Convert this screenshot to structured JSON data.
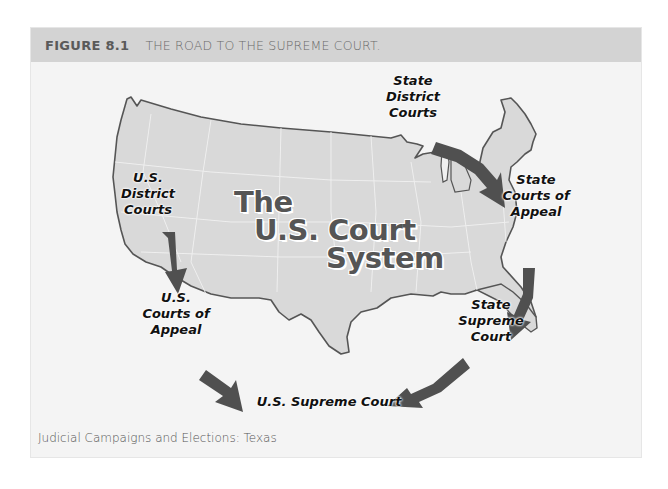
{
  "figure": {
    "number": "FIGURE 8.1",
    "title": "THE ROAD TO THE SUPREME COURT.",
    "header_color": "#d3d3d3"
  },
  "map": {
    "center_title": {
      "line1": "The",
      "line2": "U.S. Court",
      "line3": "System"
    },
    "labels": {
      "us_district_courts": "U.S.\nDistrict\nCourts",
      "us_courts_of_appeal": "U.S.\nCourts of\nAppeal",
      "us_supreme_court": "U.S. Supreme Court",
      "state_district_courts": "State\nDistrict\nCourts",
      "state_courts_of_appeal": "State\nCourts of\nAppeal",
      "state_supreme_court": "State\nSupreme\nCourt"
    },
    "colors": {
      "land": "#d9d9d9",
      "border": "#555555",
      "arrow": "#505050",
      "state_lines": "#f2f2f2"
    }
  },
  "caption": "Judicial Campaigns and Elections: Texas"
}
